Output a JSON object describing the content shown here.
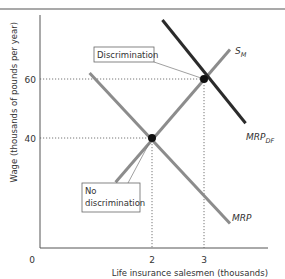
{
  "chart_data": {
    "type": "line",
    "title": "",
    "xlabel": "Life insurance salesmen (thousands)",
    "ylabel": "Wage (thousands of pounds per year)",
    "xlim": [
      0,
      4.2
    ],
    "ylim": [
      0,
      80
    ],
    "origin_label": "0",
    "x_ticks": [
      {
        "value": 2,
        "label": "2"
      },
      {
        "value": 3,
        "label": "3"
      }
    ],
    "y_ticks": [
      {
        "value": 40,
        "label": "40"
      },
      {
        "value": 60,
        "label": "60"
      }
    ],
    "grid": false,
    "series": [
      {
        "name": "S_M",
        "label_main": "S",
        "label_sub": "M",
        "color": "#8c8c8c",
        "points": [
          {
            "x": 1.3,
            "y": 25
          },
          {
            "x": 3.5,
            "y": 70
          }
        ]
      },
      {
        "name": "MRP_DF",
        "label_main": "MRP",
        "label_sub": "DF",
        "color": "#2b2b2b",
        "points": [
          {
            "x": 2.2,
            "y": 80
          },
          {
            "x": 3.8,
            "y": 45
          }
        ]
      },
      {
        "name": "MRP",
        "label_main": "MRP",
        "label_sub": "",
        "color": "#8c8c8c",
        "points": [
          {
            "x": 0.8,
            "y": 62
          },
          {
            "x": 3.5,
            "y": 11
          }
        ]
      }
    ],
    "equilibria": [
      {
        "name": "discrimination",
        "x": 3,
        "y": 60
      },
      {
        "name": "no-discrimination",
        "x": 2,
        "y": 40
      }
    ],
    "annotations": [
      {
        "name": "discrimination-label",
        "lines": [
          "Discrimination"
        ],
        "points_to": "discrimination"
      },
      {
        "name": "no-discrimination-label",
        "lines": [
          "No",
          "discrimination"
        ],
        "points_to": "no-discrimination"
      }
    ]
  }
}
